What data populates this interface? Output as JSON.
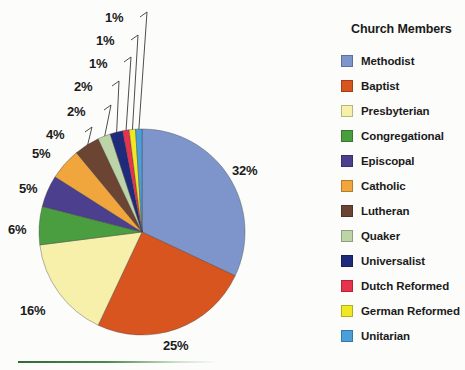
{
  "legend": {
    "title": "Church Members"
  },
  "bottom_rule": {
    "name": "green-divider"
  },
  "chart_data": {
    "type": "pie",
    "title": "Church Members",
    "legend_position": "right",
    "start_angle_deg": 0,
    "direction": "clockwise",
    "total": 100,
    "unit": "%",
    "categories": [
      "Methodist",
      "Baptist",
      "Presbyterian",
      "Congregational",
      "Episcopal",
      "Catholic",
      "Lutheran",
      "Quaker",
      "Universalist",
      "Dutch Reformed",
      "German Reformed",
      "Unitarian"
    ],
    "values": [
      32,
      25,
      16,
      6,
      5,
      5,
      4,
      2,
      2,
      1,
      1,
      1
    ],
    "labels": [
      "32%",
      "25%",
      "16%",
      "6%",
      "5%",
      "5%",
      "4%",
      "2%",
      "2%",
      "1%",
      "1%",
      "1%"
    ],
    "colors": [
      "#7e95cc",
      "#d9551f",
      "#f7f0ab",
      "#4a9e3f",
      "#4b3f8e",
      "#f0a63c",
      "#6b4434",
      "#bdd4a8",
      "#1f2a7a",
      "#e8334f",
      "#f0e822",
      "#4a9fd8"
    ],
    "slices": [
      {
        "label": "Methodist",
        "value": 32,
        "display": "32%",
        "color": "#7e95cc"
      },
      {
        "label": "Baptist",
        "value": 25,
        "display": "25%",
        "color": "#d9551f"
      },
      {
        "label": "Presbyterian",
        "value": 16,
        "display": "16%",
        "color": "#f7f0ab"
      },
      {
        "label": "Congregational",
        "value": 6,
        "display": "6%",
        "color": "#4a9e3f"
      },
      {
        "label": "Episcopal",
        "value": 5,
        "display": "5%",
        "color": "#4b3f8e"
      },
      {
        "label": "Catholic",
        "value": 5,
        "display": "5%",
        "color": "#f0a63c"
      },
      {
        "label": "Lutheran",
        "value": 4,
        "display": "4%",
        "color": "#6b4434"
      },
      {
        "label": "Quaker",
        "value": 2,
        "display": "2%",
        "color": "#bdd4a8"
      },
      {
        "label": "Universalist",
        "value": 2,
        "display": "2%",
        "color": "#1f2a7a"
      },
      {
        "label": "Dutch Reformed",
        "value": 1,
        "display": "1%",
        "color": "#e8334f"
      },
      {
        "label": "German Reformed",
        "value": 1,
        "display": "1%",
        "color": "#f0e822"
      },
      {
        "label": "Unitarian",
        "value": 1,
        "display": "1%",
        "color": "#4a9fd8"
      }
    ]
  },
  "geometry": {
    "center_x": 142,
    "center_y": 232,
    "radius": 103
  }
}
